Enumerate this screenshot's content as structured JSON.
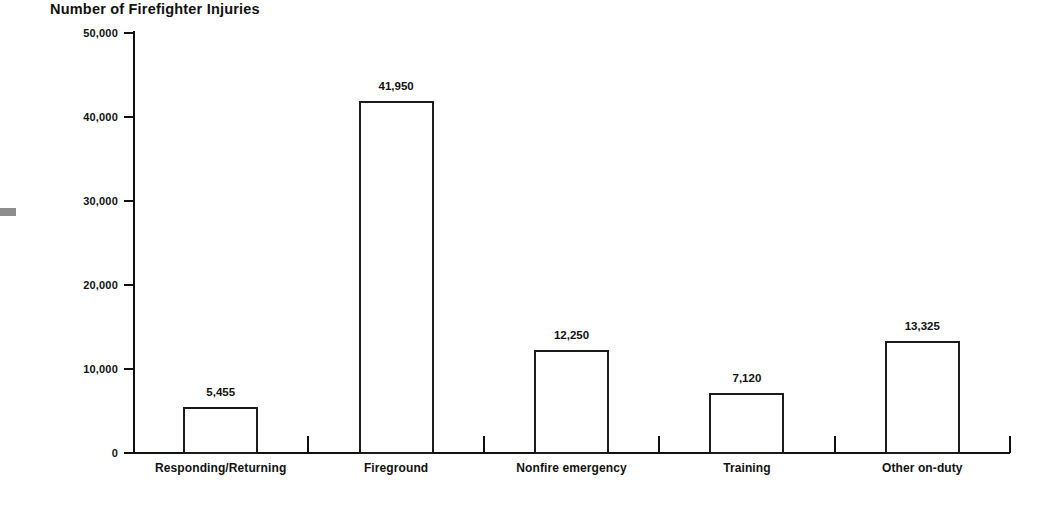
{
  "chart_data": {
    "type": "bar",
    "title": "Number of Firefighter Injuries",
    "xlabel": "",
    "ylabel": "",
    "categories": [
      "Responding/Returning",
      "Fireground",
      "Nonfire emergency",
      "Training",
      "Other on-duty"
    ],
    "values": [
      5455,
      41950,
      12250,
      7120,
      13325
    ],
    "value_labels": [
      "5,455",
      "41,950",
      "12,250",
      "7,120",
      "13,325"
    ],
    "ylim": [
      0,
      50000
    ],
    "ytick_values": [
      0,
      10000,
      20000,
      30000,
      40000,
      50000
    ],
    "ytick_labels": [
      "0",
      "10,000",
      "20,000",
      "30,000",
      "40,000",
      "50,000"
    ],
    "grid": false,
    "legend": null,
    "bar_fill_color": "#ffffff",
    "bar_outline_color": "#1b1b1b",
    "axis_color": "#111111",
    "text_color": "#111111"
  }
}
